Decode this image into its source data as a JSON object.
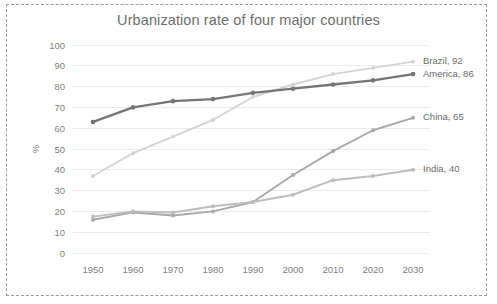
{
  "chart_data": {
    "type": "line",
    "title": "Urbanization rate of four major countries",
    "xlabel": "",
    "ylabel": "%",
    "categories": [
      "1950",
      "1960",
      "1970",
      "1980",
      "1990",
      "2000",
      "2010",
      "2020",
      "2030"
    ],
    "x": [
      1950,
      1960,
      1970,
      1980,
      1990,
      2000,
      2010,
      2020,
      2030
    ],
    "ylim": [
      0,
      100
    ],
    "yticks": [
      "100",
      "90",
      "80",
      "70",
      "60",
      "50",
      "40",
      "30",
      "20",
      "10",
      "0"
    ],
    "ytick_values": [
      100,
      90,
      80,
      70,
      60,
      50,
      40,
      30,
      20,
      10,
      0
    ],
    "grid": true,
    "legend_position": "end-of-line-labels",
    "series": [
      {
        "name": "Brazil",
        "values": [
          37,
          48,
          56,
          64,
          75,
          81,
          86,
          89,
          92
        ],
        "end_label": "Brazil, 92",
        "end_value": 92,
        "color": "#d4d4d4"
      },
      {
        "name": "America",
        "values": [
          63,
          70,
          73,
          74,
          77,
          79,
          81,
          83,
          86
        ],
        "end_label": "America, 86",
        "end_value": 86,
        "color": "#757575"
      },
      {
        "name": "China",
        "values": [
          16,
          19.5,
          18,
          20,
          24.5,
          37.5,
          49,
          59,
          65
        ],
        "end_label": "China, 65",
        "end_value": 65,
        "color": "#a8a8a8"
      },
      {
        "name": "India",
        "values": [
          17.5,
          20,
          19.5,
          22.5,
          24.5,
          28,
          35,
          37,
          40
        ],
        "end_label": "India, 40",
        "end_value": 40,
        "color": "#bdbdbd"
      }
    ]
  },
  "frame": {
    "border_style": "dashed",
    "border_color": "#9a9a9a"
  }
}
